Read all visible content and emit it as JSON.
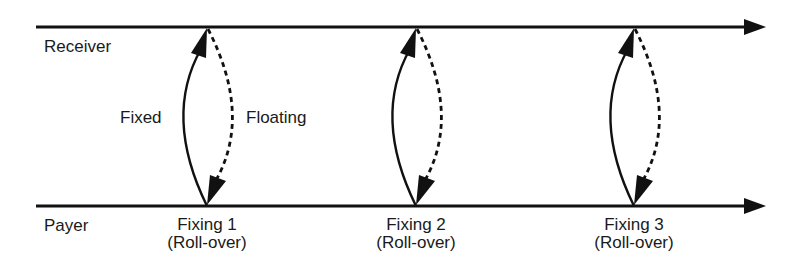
{
  "diagram": {
    "title": "",
    "colors": {
      "line": "#111111",
      "text": "#1a1a1a",
      "background": "#ffffff"
    },
    "axes": {
      "receiver": {
        "label": "Receiver",
        "y": 27,
        "x_start": 36,
        "x_end": 766
      },
      "payer": {
        "label": "Payer",
        "y": 206,
        "x_start": 36,
        "x_end": 766
      }
    },
    "flow_labels": {
      "fixed": "Fixed",
      "floating": "Floating"
    },
    "legend": [
      {
        "style": "solid",
        "meaning": "Fixed",
        "direction": "Payer to Receiver"
      },
      {
        "style": "dashed",
        "meaning": "Floating",
        "direction": "Receiver to Payer"
      }
    ],
    "fixings": [
      {
        "x": 207,
        "label": "Fixing 1",
        "sublabel": "(Roll-over)"
      },
      {
        "x": 416,
        "label": "Fixing 2",
        "sublabel": "(Roll-over)"
      },
      {
        "x": 634,
        "label": "Fixing 3",
        "sublabel": "(Roll-over)"
      }
    ]
  }
}
